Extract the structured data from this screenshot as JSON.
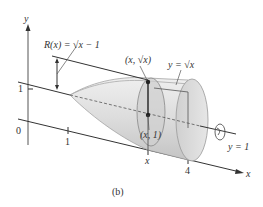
{
  "figure": {
    "caption": "(b)",
    "axes": {
      "y_label": "y",
      "x_label": "x",
      "origin_label": "0",
      "y_tick_1": "1",
      "x_tick_1": "1",
      "x_tick_x": "x",
      "x_tick_4": "4"
    },
    "annotations": {
      "radius": "R(x) = √x − 1",
      "top_point": "(x, √x)",
      "curve": "y = √x",
      "axis_point": "(x, 1)",
      "rotation_axis": "y = 1"
    },
    "colors": {
      "solid_fill": "#d8d8d8",
      "solid_light": "#ececec",
      "solid_dark": "#b8b8b8",
      "line": "#333333",
      "point": "#222222"
    }
  }
}
